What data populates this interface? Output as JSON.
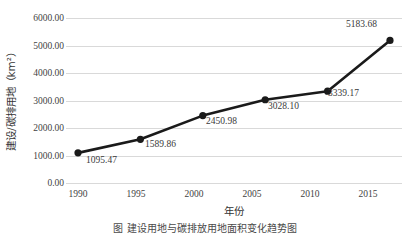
{
  "chart_data": {
    "type": "line",
    "title": "",
    "xlabel": "年份",
    "ylabel": "建设/碳排用地（km²）",
    "categories": [
      "1990",
      "1995",
      "2000",
      "2005",
      "2010",
      "2015"
    ],
    "x": [
      1990,
      1995,
      2000,
      2005,
      2010,
      2015
    ],
    "values": [
      1095.47,
      1589.86,
      2450.98,
      3028.1,
      3339.17,
      5183.68
    ],
    "point_labels": [
      "1095.47",
      "1589.86",
      "2450.98",
      "3028.10",
      "3339.17",
      "5183.68"
    ],
    "ylim": [
      0,
      6000
    ],
    "ytick_labels": [
      "0.00",
      "1000.00",
      "2000.00",
      "3000.00",
      "4000.00",
      "5000.00",
      "6000.00"
    ],
    "ytick_values": [
      0,
      1000,
      2000,
      3000,
      4000,
      5000,
      6000
    ],
    "grid": "horizontal",
    "legend": "none",
    "series_color": "#1a1a1a",
    "grid_color": "#d9d9d9",
    "marker": "circle-filled"
  },
  "caption": {
    "text": "图 建设用地与碳排放用地面积变化趋势图"
  }
}
